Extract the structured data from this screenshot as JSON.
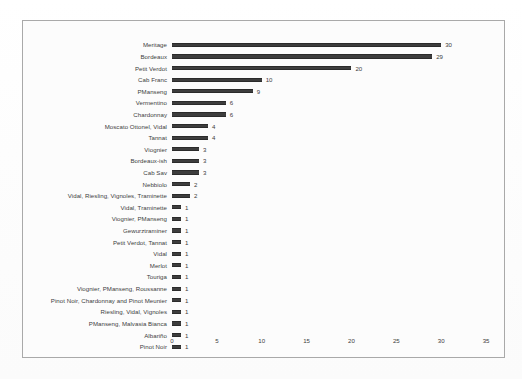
{
  "page": {
    "background_color": "#ffffff",
    "frame_border_color": "#a9a9a9"
  },
  "chart_data": {
    "type": "bar",
    "orientation": "horizontal",
    "title": "",
    "subtitle": "",
    "xlabel": "",
    "ylabel": "",
    "xlim": [
      0,
      37
    ],
    "xticks": [
      0,
      5,
      10,
      15,
      20,
      25,
      30,
      35
    ],
    "grid": false,
    "legend": null,
    "bar_color": "#3d3d3d",
    "data_labels_shown": true,
    "categories": [
      "Meritage",
      "Bordeaux",
      "Petit Verdot",
      "Cab Franc",
      "PManseng",
      "Vermentino",
      "Chardonnay",
      "Moscato Ottonel, Vidal",
      "Tannat",
      "Viognier",
      "Bordeaux-ish",
      "Cab Sav",
      "Nebbiolo",
      "Vidal, Riesling, Vignoles, Traminette",
      "Vidal, Traminette",
      "Viognier, PManseng",
      "Gewurztraminer",
      "Petit Verdot, Tannat",
      "Vidal",
      "Merlot",
      "Touriga",
      "Viognier, PManseng, Roussanne",
      "Pinot Noir, Chardonnay and Pinot Meunier",
      "Riesling, Vidal, Vignoles",
      "PManseng, Malvasia Bianca",
      "Albariño",
      "Pinot Noir"
    ],
    "values": [
      30,
      29,
      20,
      10,
      9,
      6,
      6,
      4,
      4,
      3,
      3,
      3,
      2,
      2,
      1,
      1,
      1,
      1,
      1,
      1,
      1,
      1,
      1,
      1,
      1,
      1,
      1
    ]
  }
}
